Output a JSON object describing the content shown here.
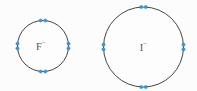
{
  "figure": {
    "background_color": "#fcfcfc",
    "circle_stroke_color": "#454545",
    "circle_stroke_width": 1,
    "circle_fill_color": "#fdfdfd",
    "label_color": "#555555",
    "label_font_size": 10.5,
    "charge_font_size": 7,
    "dot_color": "#4596d1",
    "dot_core_color": "#2e7cb8",
    "dot_radius": 1.6,
    "dot_pair_spacing": 4.6,
    "ions": [
      {
        "id": "fluoride",
        "symbol": "F",
        "charge": "−",
        "label": "F−",
        "cx": 43,
        "cy": 46,
        "r": 25.5,
        "label_dx": -2,
        "label_dy": 3.5,
        "electron_pairs": [
          "top",
          "right",
          "bottom",
          "left"
        ]
      },
      {
        "id": "iodide",
        "symbol": "I",
        "charge": "−",
        "label": "I−",
        "cx": 143.5,
        "cy": 47,
        "r": 40,
        "label_dx": 0,
        "label_dy": 3.5,
        "electron_pairs": [
          "top",
          "right",
          "bottom",
          "left"
        ]
      }
    ]
  }
}
